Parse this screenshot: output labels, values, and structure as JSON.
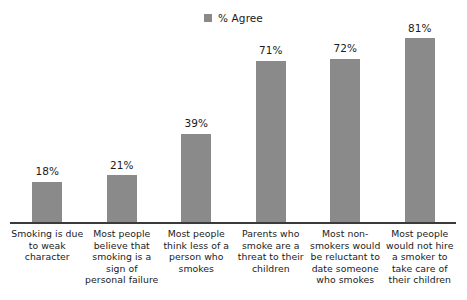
{
  "chart_data": {
    "type": "bar",
    "title": "",
    "xlabel": "",
    "ylabel": "",
    "ylim": [
      0,
      100
    ],
    "grid": false,
    "legend_position": "top-center",
    "orientation": "vertical",
    "bar_color": "#8a8a8a",
    "axis_color": "#3a3a3a",
    "text_color": "#1a1a1a",
    "background_color": "#ffffff",
    "legend": [
      {
        "name": "% Agree",
        "color": "#8a8a8a"
      }
    ],
    "categories": [
      "Smoking is due to weak character",
      "Most people believe that smoking is a sign of personal failure",
      "Most people think less of a person who smokes",
      "Parents who smoke are a threat to their children",
      "Most non-smokers would be reluctant to date someone who smokes",
      "Most people would not hire a smoker to take care of their children"
    ],
    "values": [
      18,
      21,
      39,
      71,
      72,
      81
    ],
    "value_labels": [
      "18%",
      "21%",
      "39%",
      "71%",
      "72%",
      "81%"
    ],
    "series": [
      {
        "name": "% Agree",
        "values": [
          18,
          21,
          39,
          71,
          72,
          81
        ]
      }
    ]
  }
}
